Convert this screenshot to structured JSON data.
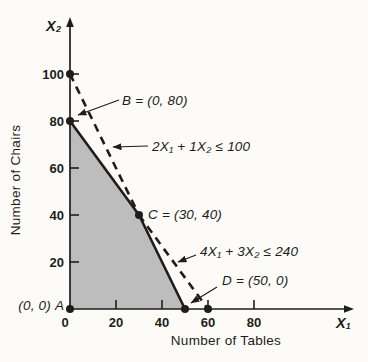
{
  "chart_data": {
    "type": "line",
    "title": "",
    "xlabel": "Number of Tables",
    "ylabel": "Number of Chairs",
    "x_axis_symbol": "X₁",
    "y_axis_symbol": "X₂",
    "xlim": [
      0,
      100
    ],
    "ylim": [
      0,
      110
    ],
    "x_ticks": [
      0,
      20,
      40,
      60,
      80
    ],
    "y_ticks": [
      20,
      40,
      60,
      80,
      100
    ],
    "grid": false,
    "constraints": [
      {
        "label": "2X₁ + 1X₂ ≤ 100",
        "intercepts": [
          [
            0,
            100
          ],
          [
            50,
            0
          ]
        ],
        "dashed_segment": [
          [
            0,
            100
          ],
          [
            30,
            40
          ]
        ],
        "solid_segment": [
          [
            30,
            40
          ],
          [
            50,
            0
          ]
        ]
      },
      {
        "label": "4X₁ + 3X₂ ≤ 240",
        "intercepts": [
          [
            0,
            80
          ],
          [
            60,
            0
          ]
        ],
        "solid_segment": [
          [
            0,
            80
          ],
          [
            30,
            40
          ]
        ],
        "dashed_segment": [
          [
            30,
            40
          ],
          [
            60,
            0
          ]
        ]
      }
    ],
    "feasible_region_vertices": [
      [
        0,
        0
      ],
      [
        0,
        80
      ],
      [
        30,
        40
      ],
      [
        50,
        0
      ]
    ],
    "corner_points": [
      {
        "name": "A",
        "label": "(0, 0)",
        "coords": [
          0,
          0
        ]
      },
      {
        "name": "B",
        "label": "B = (0, 80)",
        "coords": [
          0,
          80
        ]
      },
      {
        "name": "C",
        "label": "C = (30, 40)",
        "coords": [
          30,
          40
        ]
      },
      {
        "name": "D",
        "label": "D = (50, 0)",
        "coords": [
          50,
          0
        ]
      }
    ],
    "extra_dots": [
      [
        0,
        100
      ],
      [
        60,
        0
      ]
    ],
    "colors": {
      "region_fill": "#bdbdbd",
      "ink": "#1d1d1b",
      "background": "#fcfbf7"
    }
  }
}
